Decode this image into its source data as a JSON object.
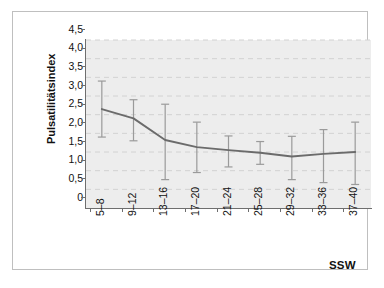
{
  "chart_data": {
    "type": "line",
    "title": "",
    "subtitle": "",
    "xlabel": "SSW",
    "ylabel": "Pulsatilitätsindex",
    "categories": [
      "5–8",
      "9–12",
      "13–16",
      "17–20",
      "21–24",
      "25–28",
      "29–32",
      "33–36",
      "37–40"
    ],
    "values": [
      2.65,
      2.4,
      1.82,
      1.63,
      1.55,
      1.48,
      1.38,
      1.45,
      1.5
    ],
    "error_upper": [
      3.4,
      2.9,
      2.78,
      2.3,
      1.93,
      1.78,
      1.92,
      2.1,
      2.3
    ],
    "error_lower": [
      1.9,
      1.8,
      0.76,
      0.95,
      1.1,
      1.17,
      0.76,
      0.68,
      0.63
    ],
    "error_type": "range-bars",
    "ylim": [
      0,
      4.5
    ],
    "ytick_values": [
      0,
      0.5,
      1.0,
      1.5,
      2.0,
      2.5,
      3.0,
      3.5,
      4.0,
      4.5
    ],
    "ytick_labels": [
      "0",
      "0,5",
      "1,0",
      "1,5",
      "2,0",
      "2,5",
      "3,0",
      "3,5",
      "4,0",
      "4,5"
    ],
    "grid": "horizontal-dashed",
    "legend": "none",
    "series": [
      {
        "name": "Pulsatilitätsindex",
        "values": [
          2.65,
          2.4,
          1.82,
          1.63,
          1.55,
          1.48,
          1.38,
          1.45,
          1.5
        ]
      }
    ],
    "colors": {
      "line": "#6b6b6b",
      "error_bar": "#9a9a9a",
      "panel_background": "#ededed",
      "gridline": "#d2d2d2",
      "axis": "#6e6e6e",
      "figure_background": "#ffffff",
      "frame_border": "#bfbfbf",
      "text": "#111111"
    }
  }
}
